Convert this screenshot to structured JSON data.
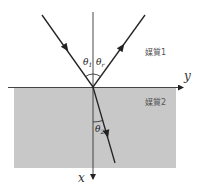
{
  "diagram": {
    "type": "refraction-reflection",
    "colors": {
      "background": "#ffffff",
      "medium2_fill": "#c8c8c8",
      "line": "#222222",
      "label": "#555555"
    },
    "media": [
      {
        "label": "媒質1"
      },
      {
        "label": "媒質2"
      }
    ],
    "axes": {
      "horizontal": "y",
      "vertical": "x"
    },
    "angles": {
      "incident": {
        "symbol": "θ",
        "subscript": "1"
      },
      "reflected": {
        "symbol": "θ",
        "subscript": "r"
      },
      "refracted": {
        "symbol": "θ",
        "subscript": "2"
      }
    },
    "rays": [
      {
        "name": "incident-ray",
        "from": [
          42,
          15
        ],
        "to": [
          93,
          87
        ]
      },
      {
        "name": "reflected-ray",
        "from": [
          93,
          87
        ],
        "to": [
          145,
          15
        ]
      },
      {
        "name": "refracted-ray",
        "from": [
          93,
          87
        ],
        "to": [
          115,
          163
        ]
      }
    ]
  }
}
